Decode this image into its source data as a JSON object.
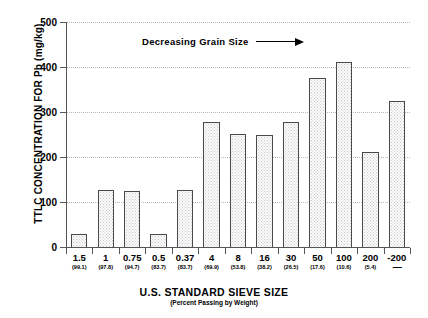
{
  "chart_data": {
    "type": "bar",
    "title": "",
    "xlabel": "U.S. STANDARD SIEVE SIZE",
    "xlabel_sub": "(Percent Passing by Weight)",
    "ylabel": "TTLC CONCENTRATION FOR Pb (mg/kg)",
    "ylim": [
      0,
      500
    ],
    "yticks": [
      0,
      100,
      200,
      300,
      400,
      500
    ],
    "ytick_labels": [
      "0",
      "100",
      "200",
      "300",
      "400",
      "500"
    ],
    "grid": true,
    "legend": "none",
    "categories": [
      "1.5",
      "1",
      "0.75",
      "0.5",
      "0.37",
      "4",
      "8",
      "16",
      "30",
      "50",
      "100",
      "200",
      "-200"
    ],
    "category_sublabels": [
      "(99.1)",
      "(97.8)",
      "(94.7)",
      "(83.7)",
      "(83.7)",
      "(69.9)",
      "(53.8)",
      "(38.2)",
      "(26.5)",
      "(17.6)",
      "(10.6)",
      "(5.4)",
      "—"
    ],
    "values": [
      28,
      125,
      124,
      27,
      125,
      277,
      250,
      248,
      277,
      376,
      410,
      210,
      324
    ],
    "annotations": [
      {
        "text": "Decreasing Grain Size",
        "arrow": "right"
      }
    ],
    "colors": {
      "bar_fill": "#fbfbfb",
      "bar_pattern": "#c9c9c9",
      "bar_border": "#4a4a4a",
      "axis": "#555555",
      "grid": "#b8b8b8",
      "text": "#000000",
      "background": "#ffffff"
    }
  }
}
